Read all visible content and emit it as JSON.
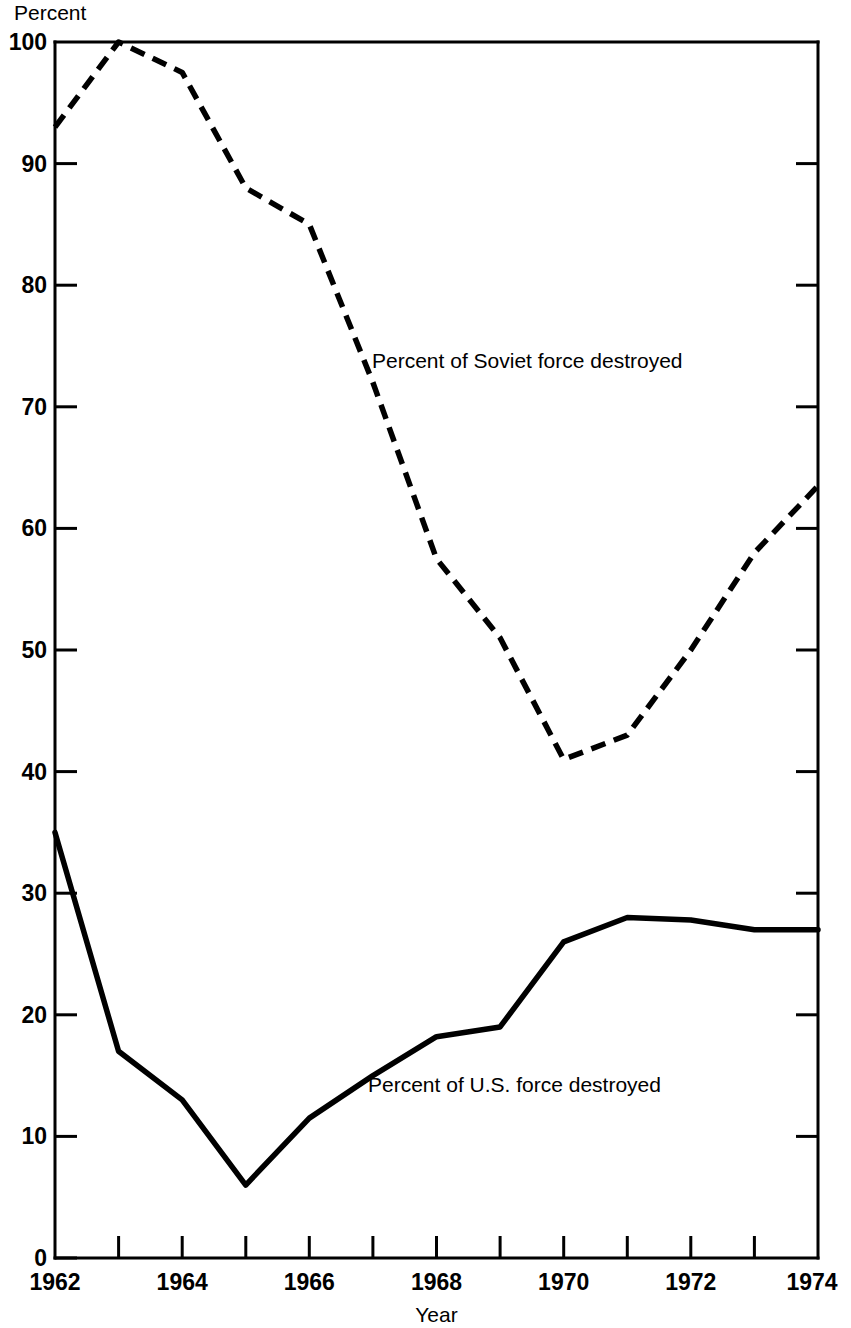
{
  "chart_data": {
    "type": "line",
    "title": "",
    "xlabel": "Year",
    "ylabel": "Percent",
    "ylim": [
      0,
      100
    ],
    "xlim": [
      1962,
      1974
    ],
    "grid": false,
    "legend_position": "inline-annotations",
    "x": [
      1962,
      1963,
      1964,
      1965,
      1966,
      1967,
      1968,
      1969,
      1970,
      1971,
      1972,
      1973,
      1974
    ],
    "x_tick_labels": [
      "1962",
      "",
      "1964",
      "",
      "1966",
      "",
      "1968",
      "",
      "1970",
      "",
      "1972",
      "",
      "1974"
    ],
    "y_ticks": [
      0,
      10,
      20,
      30,
      40,
      50,
      60,
      70,
      80,
      90,
      100
    ],
    "y_tick_labels": [
      "0",
      "10",
      "20",
      "30",
      "40",
      "50",
      "60",
      "70",
      "80",
      "90",
      "100"
    ],
    "series": [
      {
        "name": "Percent of Soviet force destroyed",
        "style": "dashed",
        "annotation": "Percent of Soviet force destroyed",
        "values": [
          93,
          100,
          97.5,
          88,
          85,
          72,
          57.5,
          51,
          41,
          43,
          50,
          58,
          63.5
        ]
      },
      {
        "name": "Percent of U.S. force destroyed",
        "style": "solid",
        "annotation": "Percent of U.S. force destroyed",
        "values": [
          35,
          17,
          13,
          6,
          11.5,
          15,
          18.2,
          19,
          26,
          28,
          27.8,
          27,
          27
        ]
      }
    ]
  },
  "axes": {
    "y_axis_caption": "Percent",
    "x_axis_caption": "Year"
  },
  "annotations": {
    "soviet_label": "Percent of Soviet force destroyed",
    "us_label": "Percent of U.S. force destroyed"
  },
  "colors": {
    "line": "#000000",
    "background": "#ffffff",
    "axis": "#000000"
  }
}
